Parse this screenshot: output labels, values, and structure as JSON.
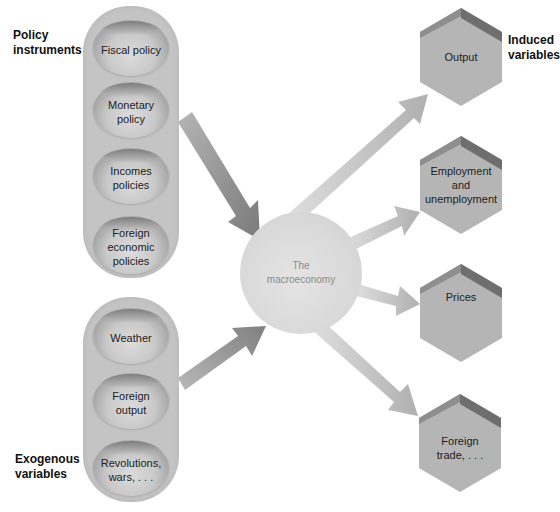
{
  "diagram": {
    "title_left_top": "Policy instruments",
    "title_left_top_lines": [
      "Policy",
      "instruments"
    ],
    "title_left_bottom_lines": [
      "Exogenous",
      "variables"
    ],
    "title_right_top_lines": [
      "Induced",
      "variables"
    ],
    "center": {
      "label_lines": [
        "The",
        "macroeconomy"
      ]
    },
    "policy_instruments": [
      {
        "lines": [
          "Fiscal policy"
        ]
      },
      {
        "lines": [
          "Monetary",
          "policy"
        ]
      },
      {
        "lines": [
          "Incomes",
          "policies"
        ]
      },
      {
        "lines": [
          "Foreign",
          "economic",
          "policies"
        ]
      }
    ],
    "exogenous_variables": [
      {
        "lines": [
          "Weather"
        ]
      },
      {
        "lines": [
          "Foreign",
          "output"
        ]
      },
      {
        "lines": [
          "Revolutions,",
          "wars, . . ."
        ]
      }
    ],
    "induced_variables": [
      {
        "lines": [
          "Output"
        ]
      },
      {
        "lines": [
          "Employment",
          "and",
          "unemployment"
        ]
      },
      {
        "lines": [
          "Prices"
        ]
      },
      {
        "lines": [
          "Foreign",
          "trade, . . ."
        ]
      }
    ],
    "colors": {
      "container": "#c4c4c4",
      "oval_light": "#dcdcdc",
      "oval_dark": "#7d7d7d",
      "circle": "#d9d9d9",
      "hexagon": "#b5b5b5",
      "hexagon_top_dark": "#6e6e6e",
      "arrow_in": "#8a8a8a",
      "arrow_out": "#c0c0c0",
      "text": "#222222"
    }
  }
}
